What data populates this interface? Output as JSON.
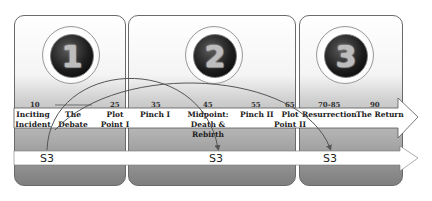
{
  "acts": [
    {
      "number": "1"
    },
    {
      "number": "2"
    },
    {
      "number": "3"
    }
  ],
  "beats": [
    {
      "page": "10",
      "label": "Inciting Incident"
    },
    {
      "page": "",
      "label": "The Debate"
    },
    {
      "page": "25",
      "label": "Plot Point I"
    },
    {
      "page": "35",
      "label": "Pinch I"
    },
    {
      "page": "45",
      "label": "Midpoint: Death & Rebirth"
    },
    {
      "page": "55",
      "label": "Pinch II"
    },
    {
      "page": "65",
      "label": "Plot Point II"
    },
    {
      "page": "70-85",
      "label": "Resurrection"
    },
    {
      "page": "90",
      "label": "The Return"
    }
  ],
  "s3_markers": [
    "S3",
    "S3",
    "S3"
  ],
  "colors": {
    "arrow_fill": "#ffffff",
    "arrow_stroke": "#555555",
    "panel_border": "#6a6a6a",
    "curve": "#555555"
  }
}
